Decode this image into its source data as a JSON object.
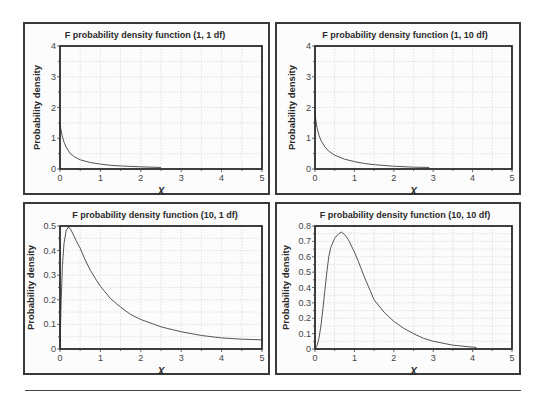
{
  "chart_data": [
    {
      "id": "f_1_1",
      "type": "line",
      "title": "F probability density function (1, 1 df)",
      "xlabel": "X",
      "ylabel": "Probability density",
      "xlim": [
        0,
        5
      ],
      "ylim": [
        0,
        4
      ],
      "xticks": [
        0,
        1,
        2,
        3,
        4,
        5
      ],
      "yticks": [
        0,
        1,
        2,
        3,
        4
      ],
      "x_tick_labels": [
        "0",
        "1",
        "2",
        "3",
        "4",
        "5"
      ],
      "y_tick_labels": [
        "0",
        "1",
        "2",
        "3",
        "4"
      ],
      "grid": true,
      "legend": null,
      "series": [
        {
          "name": "F(1,1)",
          "x": [
            0.0,
            0.02,
            0.05,
            0.1,
            0.15,
            0.25,
            0.35,
            0.5,
            0.75,
            1.0,
            1.25,
            1.5,
            2.0,
            2.5
          ],
          "y": [
            1.5,
            1.3,
            1.1,
            0.87,
            0.72,
            0.51,
            0.4,
            0.3,
            0.21,
            0.16,
            0.12,
            0.1,
            0.07,
            0.05
          ]
        }
      ]
    },
    {
      "id": "f_1_10",
      "type": "line",
      "title": "F probability density function (1, 10 df)",
      "xlabel": "X",
      "ylabel": "Probability density",
      "xlim": [
        0,
        5
      ],
      "ylim": [
        0,
        4
      ],
      "xticks": [
        0,
        1,
        2,
        3,
        4,
        5
      ],
      "yticks": [
        0,
        1,
        2,
        3,
        4
      ],
      "x_tick_labels": [
        "0",
        "1",
        "2",
        "3",
        "4",
        "5"
      ],
      "y_tick_labels": [
        "0",
        "1",
        "2",
        "3",
        "4"
      ],
      "grid": true,
      "legend": null,
      "series": [
        {
          "name": "F(1,10)",
          "x": [
            0.0,
            0.02,
            0.05,
            0.1,
            0.15,
            0.25,
            0.35,
            0.5,
            0.75,
            1.0,
            1.25,
            1.5,
            2.0,
            2.5,
            2.9
          ],
          "y": [
            1.9,
            1.6,
            1.35,
            1.1,
            0.93,
            0.72,
            0.58,
            0.45,
            0.32,
            0.24,
            0.18,
            0.14,
            0.09,
            0.06,
            0.05
          ]
        }
      ]
    },
    {
      "id": "f_10_1",
      "type": "line",
      "title": "F probability density function (10, 1 df)",
      "xlabel": "X",
      "ylabel": "Probability density",
      "xlim": [
        0,
        5
      ],
      "ylim": [
        0,
        0.5
      ],
      "xticks": [
        0,
        1,
        2,
        3,
        4,
        5
      ],
      "yticks": [
        0,
        0.1,
        0.2,
        0.3,
        0.4,
        0.5
      ],
      "x_tick_labels": [
        "0",
        "1",
        "2",
        "3",
        "4",
        "5"
      ],
      "y_tick_labels": [
        "0",
        "0.1",
        "0.2",
        "0.3",
        "0.4",
        "0.5"
      ],
      "grid": true,
      "legend": null,
      "series": [
        {
          "name": "F(10,1)",
          "x": [
            0.0,
            0.03,
            0.06,
            0.1,
            0.15,
            0.2,
            0.25,
            0.3,
            0.4,
            0.5,
            0.6,
            0.75,
            0.9,
            1.0,
            1.25,
            1.5,
            1.75,
            2.0,
            2.5,
            3.0,
            3.5,
            4.0,
            4.5,
            5.0
          ],
          "y": [
            0.0,
            0.2,
            0.34,
            0.43,
            0.48,
            0.495,
            0.49,
            0.475,
            0.44,
            0.41,
            0.37,
            0.32,
            0.28,
            0.255,
            0.205,
            0.17,
            0.14,
            0.12,
            0.09,
            0.07,
            0.055,
            0.045,
            0.04,
            0.037
          ]
        }
      ]
    },
    {
      "id": "f_10_10",
      "type": "line",
      "title": "F probability density function (10, 10 df)",
      "xlabel": "X",
      "ylabel": "Probability density",
      "xlim": [
        0,
        5
      ],
      "ylim": [
        0,
        0.8
      ],
      "xticks": [
        0,
        1,
        2,
        3,
        4,
        5
      ],
      "yticks": [
        0,
        0.1,
        0.2,
        0.3,
        0.4,
        0.5,
        0.6,
        0.7,
        0.8
      ],
      "x_tick_labels": [
        "0",
        "1",
        "2",
        "3",
        "4",
        "5"
      ],
      "y_tick_labels": [
        "0",
        "0.1",
        "0.2",
        "0.3",
        "0.4",
        "0.5",
        "0.6",
        "0.7",
        "0.8"
      ],
      "grid": true,
      "legend": null,
      "series": [
        {
          "name": "F(10,10)",
          "x": [
            0.0,
            0.05,
            0.1,
            0.15,
            0.2,
            0.25,
            0.3,
            0.35,
            0.4,
            0.5,
            0.6,
            0.67,
            0.75,
            0.85,
            1.0,
            1.1,
            1.25,
            1.4,
            1.5,
            1.75,
            2.0,
            2.25,
            2.5,
            2.75,
            3.0,
            3.5,
            4.0,
            4.1
          ],
          "y": [
            0.0,
            0.02,
            0.07,
            0.15,
            0.26,
            0.38,
            0.5,
            0.6,
            0.66,
            0.72,
            0.75,
            0.76,
            0.745,
            0.71,
            0.63,
            0.57,
            0.47,
            0.38,
            0.32,
            0.24,
            0.18,
            0.135,
            0.1,
            0.07,
            0.05,
            0.025,
            0.012,
            0.01
          ]
        }
      ]
    }
  ],
  "panels": [
    {
      "title": "F probability density function (1, 1 df)",
      "ylabel": "Probability density",
      "xlabel": "X"
    },
    {
      "title": "F probability density function (1, 10 df)",
      "ylabel": "Probability density",
      "xlabel": "X"
    },
    {
      "title": "F probability density function (10, 1 df)",
      "ylabel": "Probability density",
      "xlabel": "X"
    },
    {
      "title": "F probability density function (10, 10 df)",
      "ylabel": "Probability density",
      "xlabel": "X"
    }
  ],
  "colors": {
    "frame": "#2a2a2a",
    "curve": "#555555",
    "grid": "#cfcfcf",
    "panel_border": "#3a3a3a",
    "background": "#fcfcfc"
  }
}
